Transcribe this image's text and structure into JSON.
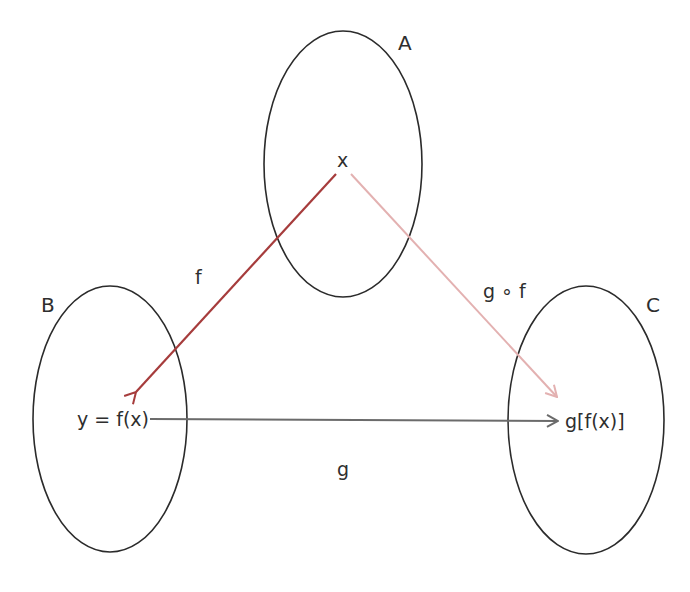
{
  "diagram": {
    "sets": [
      {
        "name": "A",
        "label": "A"
      },
      {
        "name": "B",
        "label": "B"
      },
      {
        "name": "C",
        "label": "C"
      }
    ],
    "elements": {
      "x": "x",
      "y": "y = f(x)",
      "z": "g[f(x)]"
    },
    "arrows": {
      "f": {
        "label": "f",
        "from": "A",
        "to": "B",
        "color": "#a63c3c"
      },
      "g": {
        "label": "g",
        "from": "B",
        "to": "C",
        "color": "#6b6b6b"
      },
      "gof": {
        "label": "g ∘ f",
        "from": "A",
        "to": "C",
        "color": "#e3b1b1"
      }
    },
    "colors": {
      "outline": "#2b2b2b",
      "text": "#2e2e2e"
    }
  }
}
